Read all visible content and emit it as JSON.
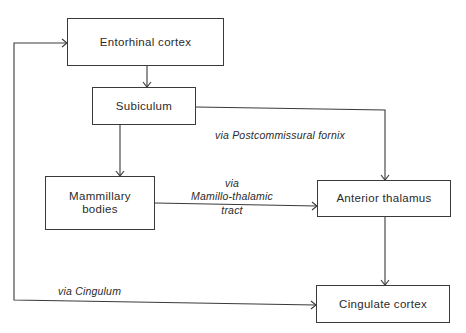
{
  "diagram": {
    "nodes": {
      "entorhinal": {
        "label": "Entorhinal cortex"
      },
      "subiculum": {
        "label": "Subiculum"
      },
      "mammillary": {
        "label_line1": "Mammillary",
        "label_line2": "bodies"
      },
      "anterior_thalamus": {
        "label": "Anterior thalamus"
      },
      "cingulate": {
        "label": "Cingulate cortex"
      }
    },
    "edges": [
      {
        "from": "Entorhinal cortex",
        "to": "Subiculum",
        "label": ""
      },
      {
        "from": "Subiculum",
        "to": "Mammillary bodies",
        "label": ""
      },
      {
        "from": "Subiculum",
        "to": "Anterior thalamus",
        "label": "via Postcommissural fornix"
      },
      {
        "from": "Mammillary bodies",
        "to": "Anterior thalamus",
        "label": "via Mamillo-thalamic tract"
      },
      {
        "from": "Anterior thalamus",
        "to": "Cingulate cortex",
        "label": ""
      },
      {
        "from": "Cingulate cortex",
        "to": "Entorhinal cortex",
        "label": "via Cingulum"
      }
    ],
    "edge_labels": {
      "fornix": "via Postcommissural fornix",
      "mt_line1": "via",
      "mt_line2": "Mamillo-thalamic",
      "mt_line3": "tract",
      "cingulum": "via Cingulum"
    },
    "colors": {
      "line": "#3a3a3a",
      "background": "#ffffff"
    }
  }
}
